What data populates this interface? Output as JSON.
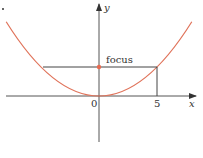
{
  "diagram": {
    "type": "parabola_focus",
    "equation": "x^2 = 10y",
    "colors": {
      "curve": "#e0735a",
      "axis": "#555555",
      "focus_dot": "#e86a50",
      "chord": "#444444"
    },
    "labels": {
      "y_axis": "y",
      "x_axis": "x",
      "origin": "0",
      "x_tick": "5",
      "focus": "focus"
    },
    "focus_point": {
      "x": 0,
      "y": 2.5
    },
    "chord_endpoints": [
      {
        "x": -5,
        "y": 2.5
      },
      {
        "x": 5,
        "y": 2.5
      }
    ],
    "vertex": {
      "x": 0,
      "y": 0
    }
  }
}
